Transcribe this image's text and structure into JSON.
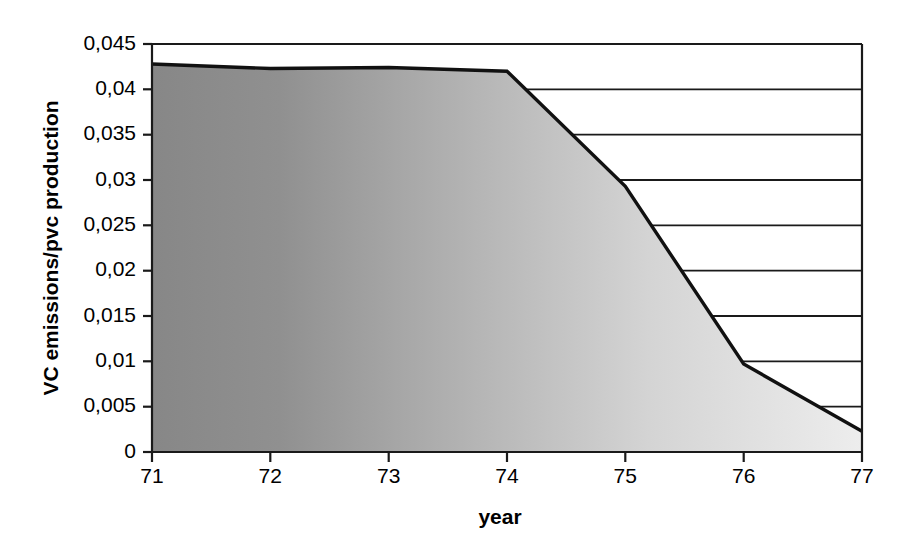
{
  "chart_data": {
    "type": "area",
    "title": "",
    "xlabel": "year",
    "ylabel": "VC emissions/pvc production",
    "x": [
      71,
      72,
      73,
      74,
      75,
      76,
      77
    ],
    "categories": [
      "71",
      "72",
      "73",
      "74",
      "75",
      "76",
      "77"
    ],
    "values": [
      0.0428,
      0.0423,
      0.0424,
      0.042,
      0.0293,
      0.0097,
      0.0023
    ],
    "series": [
      {
        "name": "VC emissions/pvc production",
        "values": [
          0.0428,
          0.0423,
          0.0424,
          0.042,
          0.0293,
          0.0097,
          0.0023
        ]
      }
    ],
    "xlim": [
      71,
      77
    ],
    "ylim": [
      0,
      0.045
    ],
    "ytick_labels": [
      "0,045",
      "0,04",
      "0,035",
      "0,03",
      "0,025",
      "0,02",
      "0,015",
      "0,01",
      "0,005",
      "0"
    ],
    "ytick_values": [
      0.045,
      0.04,
      0.035,
      0.03,
      0.025,
      0.02,
      0.015,
      0.01,
      0.005,
      0
    ],
    "xtick_labels": [
      "71",
      "72",
      "73",
      "74",
      "75",
      "76",
      "77"
    ],
    "xtick_values": [
      71,
      72,
      73,
      74,
      75,
      76,
      77
    ],
    "grid": "horizontal",
    "legend": "none",
    "decimal_separator": ",",
    "colors": {
      "line": "#111111",
      "fill_start": "#8a8a8a",
      "fill_end": "#ececec",
      "axis": "#1a1a1a",
      "background": "#ffffff"
    }
  },
  "axes": {
    "y_title": "VC emissions/pvc production",
    "x_title": "year",
    "y_labels": {
      "t0": "0,045",
      "t1": "0,04",
      "t2": "0,035",
      "t3": "0,03",
      "t4": "0,025",
      "t5": "0,02",
      "t6": "0,015",
      "t7": "0,01",
      "t8": "0,005",
      "t9": "0"
    },
    "x_labels": {
      "t0": "71",
      "t1": "72",
      "t2": "73",
      "t3": "74",
      "t4": "75",
      "t5": "76",
      "t6": "77"
    }
  }
}
